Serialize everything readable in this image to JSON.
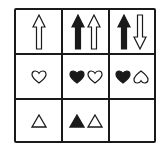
{
  "puzzle": {
    "type": "3x3 matrix reasoning grid",
    "colors": {
      "stroke": "#1a1a1a",
      "fill_black": "#1a1a1a",
      "fill_white": "#ffffff"
    },
    "rows": [
      {
        "cells": [
          {
            "shapes": [
              {
                "icon": "arrow-up-outline-icon"
              }
            ]
          },
          {
            "shapes": [
              {
                "icon": "arrow-up-filled-icon"
              },
              {
                "icon": "arrow-up-outline-icon"
              }
            ]
          },
          {
            "shapes": [
              {
                "icon": "arrow-up-filled-icon"
              },
              {
                "icon": "arrow-down-outline-icon"
              }
            ]
          }
        ]
      },
      {
        "cells": [
          {
            "shapes": [
              {
                "icon": "heart-outline-icon"
              }
            ]
          },
          {
            "shapes": [
              {
                "icon": "heart-filled-icon"
              },
              {
                "icon": "heart-outline-icon"
              }
            ]
          },
          {
            "shapes": [
              {
                "icon": "heart-filled-icon"
              },
              {
                "icon": "heart-outline-inverted-icon"
              }
            ]
          }
        ]
      },
      {
        "cells": [
          {
            "shapes": [
              {
                "icon": "triangle-outline-icon"
              }
            ]
          },
          {
            "shapes": [
              {
                "icon": "triangle-filled-icon"
              },
              {
                "icon": "triangle-outline-icon"
              }
            ]
          },
          {
            "shapes": [],
            "empty": true
          }
        ]
      }
    ]
  }
}
